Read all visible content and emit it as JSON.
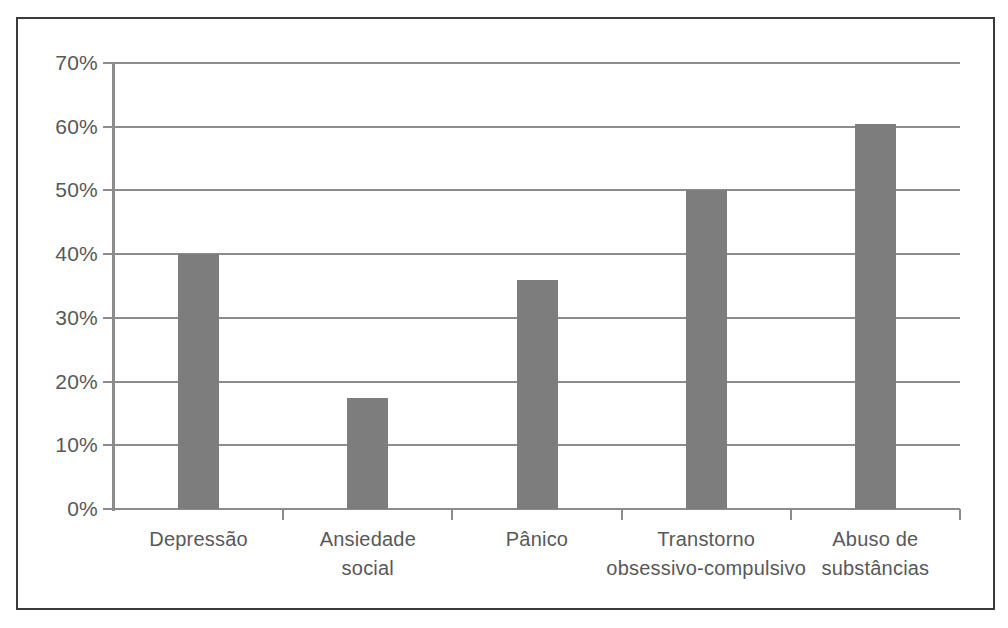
{
  "chart_data": {
    "type": "bar",
    "title": "",
    "subtitle": "",
    "xlabel": "",
    "ylabel": "",
    "categories": [
      "Depressão",
      "Ansiedade social",
      "Pânico",
      "Transtorno obsessivo-compulsivo",
      "Abuso de substâncias"
    ],
    "category_lines": [
      [
        "Depressão"
      ],
      [
        "Ansiedade",
        "social"
      ],
      [
        "Pânico"
      ],
      [
        "Transtorno",
        "obsessivo-compulsivo"
      ],
      [
        "Abuso de",
        "substâncias"
      ]
    ],
    "values": [
      40,
      17.5,
      36,
      50,
      60.4
    ],
    "value_unit": "%",
    "ylim": [
      0,
      70
    ],
    "ytick_values": [
      70,
      60,
      50,
      40,
      30,
      20,
      10,
      0
    ],
    "ytick_labels": [
      "70%",
      "60%",
      "50%",
      "40%",
      "30%",
      "20%",
      "10%",
      "0%"
    ],
    "grid": "horizontal",
    "legend": "none",
    "series": [
      {
        "name": "",
        "values": [
          40,
          17.5,
          36,
          50,
          60.4
        ]
      }
    ]
  },
  "style": {
    "bar_color": "#7d7d7d",
    "gridline_color": "#8c8c8e",
    "axis_color": "#8c8c8e",
    "frame_color": "#3a3a3c",
    "text_color": "#58585a",
    "background": "#ffffff"
  }
}
